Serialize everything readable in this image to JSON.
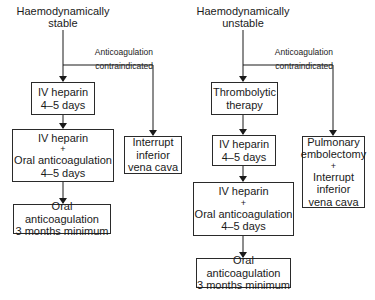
{
  "left": {
    "title": [
      "Haemodynamically",
      "stable"
    ],
    "branch_label": [
      "Anticoagulation",
      "contraindicated"
    ],
    "steps": [
      {
        "lines": [
          "IV heparin",
          "4–5 days"
        ]
      },
      {
        "lines": [
          "IV heparin",
          "+",
          "Oral anticoagulation",
          "4–5 days"
        ]
      },
      {
        "lines": [
          "Oral anticoagulation",
          "3 months minimum"
        ]
      }
    ],
    "branch_box": {
      "lines": [
        "Interrupt",
        "inferior",
        "vena cava"
      ]
    }
  },
  "right": {
    "title": [
      "Haemodynamically",
      "unstable"
    ],
    "branch_label": [
      "Anticoagulation",
      "contraindicated"
    ],
    "steps": [
      {
        "lines": [
          "Thrombolytic",
          "therapy"
        ]
      },
      {
        "lines": [
          "IV heparin",
          "4–5 days"
        ]
      },
      {
        "lines": [
          "IV heparin",
          "+",
          "Oral anticoagulation",
          "4–5 days"
        ]
      },
      {
        "lines": [
          "Oral anticoagulation",
          "3 months minimum"
        ]
      }
    ],
    "branch_box": {
      "lines": [
        "Pulmonary",
        "embolectomy",
        "+",
        "Interrupt",
        "inferior",
        "vena cava"
      ]
    }
  },
  "colors": {
    "line": "#1a1a1a",
    "background": "#ffffff"
  }
}
